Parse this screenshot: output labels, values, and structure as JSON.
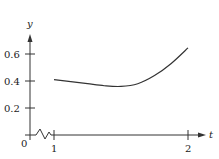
{
  "chart_data": {
    "type": "line",
    "title": "",
    "xlabel": "t",
    "ylabel": "y",
    "x_ticks": [
      {
        "value": 1,
        "label": "1"
      },
      {
        "value": 2,
        "label": "2"
      }
    ],
    "y_ticks": [
      {
        "value": 0.2,
        "label": "0.2"
      },
      {
        "value": 0.4,
        "label": "0.4"
      },
      {
        "value": 0.6,
        "label": "0.6"
      }
    ],
    "origin_label": "0",
    "axis_break_on_x": true,
    "xlim": [
      1,
      2
    ],
    "ylim": [
      0,
      0.7
    ],
    "grid": false,
    "legend": null,
    "series": [
      {
        "name": "y(t)",
        "x": [
          1.0,
          1.125,
          1.25,
          1.375,
          1.5,
          1.625,
          1.75,
          1.875,
          2.0
        ],
        "values": [
          0.41,
          0.395,
          0.38,
          0.365,
          0.36,
          0.38,
          0.44,
          0.53,
          0.645
        ]
      }
    ]
  },
  "color": {
    "axis": "#333333",
    "curve": "#333333",
    "text": "#222222"
  }
}
